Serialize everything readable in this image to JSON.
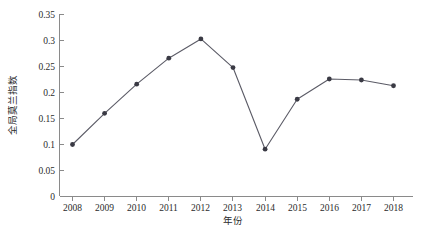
{
  "chart_data": {
    "type": "line",
    "title": "",
    "subtitle": "",
    "xlabel": "年份",
    "ylabel": "全局莫兰指数",
    "categories": [
      "2008",
      "2009",
      "2010",
      "2011",
      "2012",
      "2013",
      "2014",
      "2015",
      "2016",
      "2017",
      "2018"
    ],
    "x": [
      2008,
      2009,
      2010,
      2011,
      2012,
      2013,
      2014,
      2015,
      2016,
      2017,
      2018
    ],
    "values": [
      0.1,
      0.16,
      0.216,
      0.266,
      0.303,
      0.248,
      0.091,
      0.187,
      0.226,
      0.224,
      0.213
    ],
    "series": [
      {
        "name": "全局莫兰指数",
        "values": [
          0.1,
          0.16,
          0.216,
          0.266,
          0.303,
          0.248,
          0.091,
          0.187,
          0.226,
          0.224,
          0.213
        ]
      }
    ],
    "xlim": [
      2008,
      2018
    ],
    "ylim": [
      0,
      0.35
    ],
    "ytick_labels": [
      "0",
      "0.05",
      "0.1",
      "0.15",
      "0.2",
      "0.25",
      "0.3",
      "0.35"
    ],
    "ytick_values": [
      0,
      0.05,
      0.1,
      0.15,
      0.2,
      0.25,
      0.3,
      0.35
    ],
    "xtick_labels": [
      "2008",
      "2009",
      "2010",
      "2011",
      "2012",
      "2013",
      "2014",
      "2015",
      "2016",
      "2017",
      "2018"
    ],
    "grid": false,
    "legend": false,
    "legend_position": "none",
    "marker": "circle",
    "colors": {
      "line": "#5b5b66",
      "marker": "#3a3a44",
      "axis": "#8a8a8a",
      "text": "#2b2b2b",
      "background": "#ffffff"
    }
  },
  "axes": {
    "y_title": "全局莫兰指数",
    "x_title": "年份"
  },
  "ticks": {
    "y": [
      {
        "label": "0.35",
        "value": 0.35
      },
      {
        "label": "0.3",
        "value": 0.3
      },
      {
        "label": "0.25",
        "value": 0.25
      },
      {
        "label": "0.2",
        "value": 0.2
      },
      {
        "label": "0.15",
        "value": 0.15
      },
      {
        "label": "0.1",
        "value": 0.1
      },
      {
        "label": "0.05",
        "value": 0.05
      },
      {
        "label": "0",
        "value": 0
      }
    ],
    "x": [
      {
        "label": "2008"
      },
      {
        "label": "2009"
      },
      {
        "label": "2010"
      },
      {
        "label": "2011"
      },
      {
        "label": "2012"
      },
      {
        "label": "2013"
      },
      {
        "label": "2014"
      },
      {
        "label": "2015"
      },
      {
        "label": "2016"
      },
      {
        "label": "2017"
      },
      {
        "label": "2018"
      }
    ]
  }
}
